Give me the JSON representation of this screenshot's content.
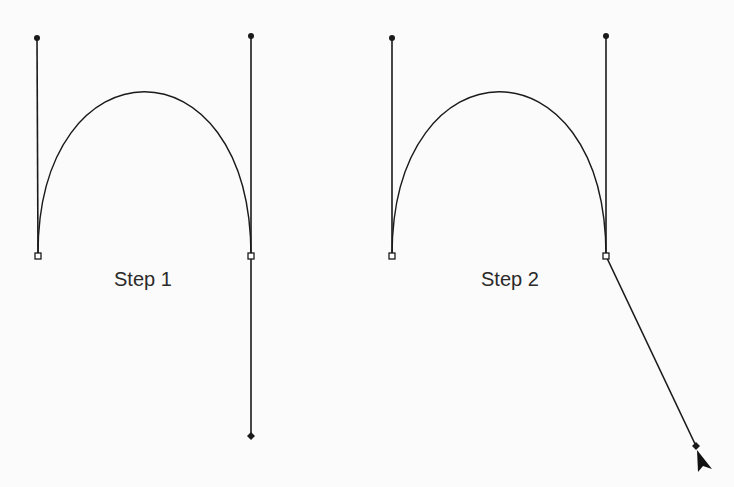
{
  "diagram": {
    "type": "bezier-path-editing-steps",
    "colors": {
      "stroke": "#1a1a1a",
      "background": "#fbfbfb",
      "anchor_fill": "#ffffff"
    },
    "panels": [
      {
        "label": "Step 1",
        "anchors": [
          {
            "x": 38,
            "y": 256,
            "handle_in": null,
            "handle_out": {
              "x": 37,
              "y": 38
            }
          },
          {
            "x": 251,
            "y": 256,
            "handle_in": {
              "x": 251,
              "y": 36
            },
            "handle_out": {
              "x": 251,
              "y": 436
            }
          }
        ]
      },
      {
        "label": "Step 2",
        "anchors": [
          {
            "x": 392,
            "y": 256,
            "handle_in": null,
            "handle_out": {
              "x": 392,
              "y": 38
            }
          },
          {
            "x": 606,
            "y": 256,
            "handle_in": {
              "x": 606,
              "y": 36
            },
            "handle_out": {
              "x": 696,
              "y": 446
            }
          }
        ],
        "cursor": {
          "icon": "arrow-pointer-icon",
          "x": 697,
          "y": 450
        }
      }
    ]
  }
}
